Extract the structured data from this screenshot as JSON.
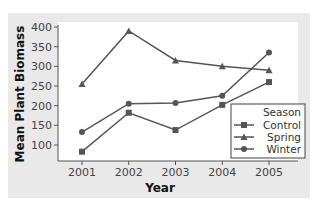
{
  "chart_data": {
    "type": "line",
    "title": "",
    "xlabel": "Year",
    "ylabel": "Mean Plant Biomass",
    "x": [
      "2001",
      "2002",
      "2003",
      "2004",
      "2005"
    ],
    "yticks": [
      100,
      150,
      200,
      250,
      300,
      350,
      400
    ],
    "ylim": [
      65,
      405
    ],
    "grid": false,
    "legend": {
      "title": "Season",
      "position": "lower right",
      "entries": [
        "Control",
        "Spring",
        "Winter"
      ]
    },
    "series": [
      {
        "name": "Control",
        "marker": "square",
        "values": [
          83,
          182,
          138,
          202,
          260
        ]
      },
      {
        "name": "Spring",
        "marker": "triangle",
        "values": [
          255,
          390,
          315,
          300,
          290
        ]
      },
      {
        "name": "Winter",
        "marker": "circle",
        "values": [
          133,
          205,
          207,
          225,
          335
        ]
      }
    ]
  },
  "colors": {
    "panel": "#e9e9e9",
    "plot": "#ffffff",
    "line": "#555555",
    "axis": "#555555"
  }
}
